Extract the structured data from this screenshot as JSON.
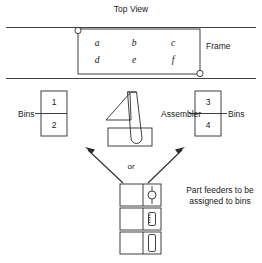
{
  "title": "Top View",
  "labels": {
    "frame": "Frame",
    "bins_left": "Bins",
    "bins_right": "Bins",
    "assembler": "Assembler",
    "or": "or",
    "feeder_note": "Part feeders to be assigned to bins"
  },
  "frame_grid": {
    "row_top": [
      "a",
      "b",
      "c"
    ],
    "row_bottom": [
      "d",
      "e",
      "f"
    ]
  },
  "bins_left": [
    "1",
    "2"
  ],
  "bins_right": [
    "3",
    "4"
  ],
  "feeders": [
    {
      "symbol": "round-part-icon"
    },
    {
      "symbol": "short-block-part-icon"
    },
    {
      "symbol": "tall-block-part-icon"
    }
  ],
  "colors": {
    "line": "#2b2b2b",
    "text": "#1a1a1a",
    "background": "#ffffff"
  }
}
